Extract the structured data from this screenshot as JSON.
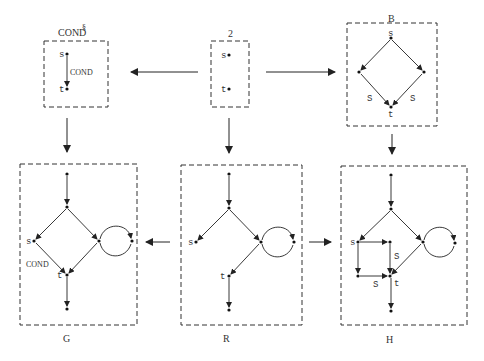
{
  "diagram": {
    "type": "graph-rewriting pushout diagram",
    "panels": {
      "cond": {
        "title": "COND",
        "superscript": "§",
        "nodes": [
          "s",
          "t"
        ],
        "edge_label": "COND"
      },
      "two": {
        "title": "2",
        "nodes": [
          "s",
          "t"
        ]
      },
      "b": {
        "title": "B",
        "nodes": [
          "s",
          "t"
        ],
        "edge_labels": [
          "S",
          "S"
        ]
      },
      "g": {
        "title": "G",
        "nodes": [
          "s",
          "t"
        ],
        "edge_label": "COND"
      },
      "r": {
        "title": "R",
        "nodes": [
          "s",
          "t"
        ]
      },
      "h": {
        "title": "H",
        "nodes": [
          "s",
          "t"
        ],
        "edge_labels": [
          "S",
          "S"
        ]
      }
    },
    "morphisms": [
      {
        "from": "2",
        "to": "COND§"
      },
      {
        "from": "2",
        "to": "B"
      },
      {
        "from": "COND§",
        "to": "G"
      },
      {
        "from": "2",
        "to": "R"
      },
      {
        "from": "B",
        "to": "H"
      },
      {
        "from": "R",
        "to": "G"
      },
      {
        "from": "R",
        "to": "H"
      }
    ]
  }
}
